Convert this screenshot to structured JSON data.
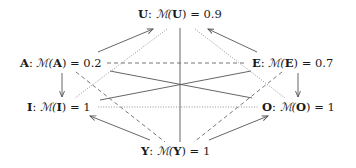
{
  "diagram": {
    "nodes": {
      "U": {
        "symbol": "U",
        "colon": ":",
        "measure": "ℳ(",
        "arg": "U",
        "close": ")",
        "eq": " = ",
        "value": "0.9"
      },
      "A": {
        "symbol": "A",
        "colon": ":",
        "measure": "ℳ(",
        "arg": "A",
        "close": ")",
        "eq": " = ",
        "value": "0.2"
      },
      "E": {
        "symbol": "E",
        "colon": ":",
        "measure": "ℳ(",
        "arg": "E",
        "close": ")",
        "eq": " = ",
        "value": "0.7"
      },
      "I": {
        "symbol": "I",
        "colon": ":",
        "measure": "ℳ(",
        "arg": "I",
        "close": ")",
        "eq": " = ",
        "value": "1"
      },
      "O": {
        "symbol": "O",
        "colon": ":",
        "measure": "ℳ(",
        "arg": "O",
        "close": ")",
        "eq": " = ",
        "value": "1"
      },
      "Y": {
        "symbol": "Y",
        "colon": ":",
        "measure": "ℳ(",
        "arg": "Y",
        "close": ")",
        "eq": " = ",
        "value": "1"
      }
    },
    "edges": [
      {
        "from": "A",
        "to": "U",
        "style": "solid",
        "arrow": true
      },
      {
        "from": "E",
        "to": "U",
        "style": "solid",
        "arrow": true
      },
      {
        "from": "A",
        "to": "I",
        "style": "solid",
        "arrow": true
      },
      {
        "from": "E",
        "to": "O",
        "style": "solid",
        "arrow": true
      },
      {
        "from": "Y",
        "to": "I",
        "style": "solid",
        "arrow": true
      },
      {
        "from": "Y",
        "to": "O",
        "style": "solid",
        "arrow": true
      },
      {
        "from": "U",
        "to": "Y",
        "style": "solid",
        "arrow": false
      },
      {
        "from": "A",
        "to": "O",
        "style": "solid",
        "arrow": false
      },
      {
        "from": "E",
        "to": "I",
        "style": "solid",
        "arrow": false
      },
      {
        "from": "A",
        "to": "E",
        "style": "dashed",
        "arrow": false
      },
      {
        "from": "A",
        "to": "Y",
        "style": "dashed",
        "arrow": false
      },
      {
        "from": "E",
        "to": "Y",
        "style": "dashed",
        "arrow": false
      },
      {
        "from": "I",
        "to": "O",
        "style": "dotted",
        "arrow": false
      },
      {
        "from": "U",
        "to": "I",
        "style": "dotted",
        "arrow": false
      },
      {
        "from": "U",
        "to": "O",
        "style": "dotted",
        "arrow": false
      }
    ],
    "colors": {
      "text": "#1a1a1a",
      "solid_edge": "#555555",
      "dashed_edge": "#666666",
      "dotted_edge": "#888888",
      "background": "#ffffff"
    }
  }
}
